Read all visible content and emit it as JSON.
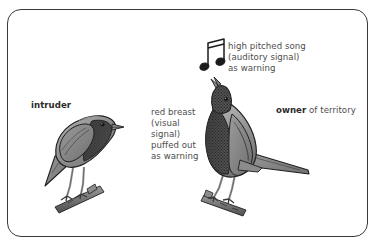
{
  "figure": {
    "name": "territorial-bird-signalling-diagram",
    "background_color": "#ffffff",
    "frame_border_color": "#3a3a3a",
    "text_color": "#4d4d4d",
    "emphasis_text_color": "#2b2b2b",
    "bird_body_color": "#8a8a8a",
    "bird_breast_color": "#4a4a4a",
    "bird_outline_color": "#1f1f1f",
    "branch_color": "#6f6f6f"
  },
  "labels": {
    "intruder": "intruder",
    "owner_bold": "owner",
    "owner_rest": " of territory",
    "song": "high pitched song\n(auditory signal)\nas warning",
    "breast": "red breast\n(visual\nsignal)\npuffed out\nas warning"
  },
  "icons": {
    "music_note": "beamed-eighth-notes-icon"
  },
  "birds": [
    {
      "role": "intruder",
      "posture": "horizontal-perched",
      "beak": "closed",
      "breast": "normal",
      "label": "intruder"
    },
    {
      "role": "owner",
      "posture": "upright-head-raised",
      "beak": "open-singing",
      "breast": "puffed-out",
      "label": "owner of territory"
    }
  ]
}
